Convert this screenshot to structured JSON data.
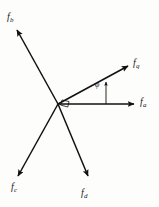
{
  "figure": {
    "kind": "vector-diagram",
    "background_color": "#fdfdfb",
    "line_color": "#111111",
    "origin": {
      "x": 58,
      "y": 104
    },
    "right_angle_marker": {
      "x": 62,
      "y": 100,
      "size": 7
    },
    "angle": {
      "symbol": "φ",
      "name": "phi",
      "label_x": 95,
      "label_y": 81,
      "indicator_line": {
        "x": 106,
        "y_bottom": 104,
        "y_top": 82
      }
    },
    "vectors": [
      {
        "id": "fb",
        "label": "f",
        "subscript": "b",
        "x1": 58,
        "y1": 104,
        "x2": 17,
        "y2": 30,
        "label_x": 7,
        "label_y": 12
      },
      {
        "id": "fq",
        "label": "f",
        "subscript": "q",
        "x1": 58,
        "y1": 104,
        "x2": 128,
        "y2": 66,
        "label_x": 133,
        "label_y": 58
      },
      {
        "id": "fa",
        "label": "f",
        "subscript": "a",
        "x1": 58,
        "y1": 104,
        "x2": 134,
        "y2": 104,
        "label_x": 140,
        "label_y": 97
      },
      {
        "id": "fc",
        "label": "f",
        "subscript": "c",
        "x1": 58,
        "y1": 104,
        "x2": 18,
        "y2": 176,
        "label_x": 11,
        "label_y": 182
      },
      {
        "id": "fd",
        "label": "f",
        "subscript": "d",
        "x1": 58,
        "y1": 104,
        "x2": 88,
        "y2": 176,
        "label_x": 81,
        "label_y": 188
      }
    ]
  }
}
